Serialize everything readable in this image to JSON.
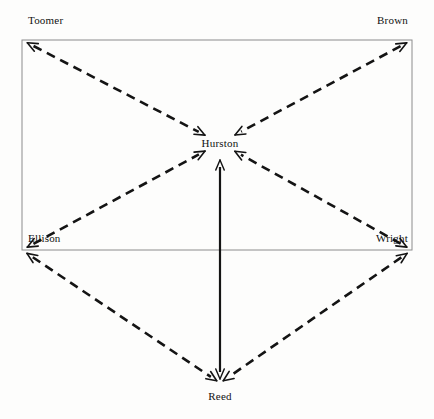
{
  "diagram": {
    "type": "directed-graph",
    "background_color": "#fdfdfc",
    "width": 434,
    "height": 419,
    "frame": {
      "name": "outer-rectangle",
      "stroke_color": "#8c8c8c",
      "stroke_width": 1,
      "x1": 22,
      "y1": 40,
      "x2": 412,
      "y2": 250
    },
    "nodes": [
      {
        "id": "toomer",
        "label": "Toomer",
        "x": 22,
        "y": 40,
        "label_x": 28,
        "label_y": 20,
        "anchor": "left"
      },
      {
        "id": "brown",
        "label": "Brown",
        "x": 412,
        "y": 40,
        "label_x": 408,
        "label_y": 20,
        "anchor": "right"
      },
      {
        "id": "hurston",
        "label": "Hurston",
        "x": 220,
        "y": 143,
        "label_x": 220,
        "label_y": 143,
        "anchor": "center"
      },
      {
        "id": "ellison",
        "label": "Ellison",
        "x": 22,
        "y": 250,
        "label_x": 28,
        "label_y": 238,
        "anchor": "left"
      },
      {
        "id": "wright",
        "label": "Wright",
        "x": 412,
        "y": 250,
        "label_x": 408,
        "label_y": 238,
        "anchor": "right"
      },
      {
        "id": "reed",
        "label": "Reed",
        "x": 220,
        "y": 383,
        "label_x": 220,
        "label_y": 396,
        "anchor": "center"
      }
    ],
    "edges": [
      {
        "id": "toomer-hurston",
        "from": "toomer",
        "to": "hurston",
        "style": "dashed",
        "arrows": "both",
        "color": "#141414",
        "width": 2.6
      },
      {
        "id": "brown-hurston",
        "from": "brown",
        "to": "hurston",
        "style": "dashed",
        "arrows": "both",
        "color": "#141414",
        "width": 2.6
      },
      {
        "id": "ellison-hurston",
        "from": "ellison",
        "to": "hurston",
        "style": "dashed",
        "arrows": "both",
        "color": "#141414",
        "width": 2.6
      },
      {
        "id": "wright-hurston",
        "from": "wright",
        "to": "hurston",
        "style": "dashed",
        "arrows": "both",
        "color": "#141414",
        "width": 2.6
      },
      {
        "id": "hurston-reed",
        "from": "hurston",
        "to": "reed",
        "style": "solid",
        "arrows": "both",
        "color": "#141414",
        "width": 2.2
      },
      {
        "id": "ellison-reed",
        "from": "ellison",
        "to": "reed",
        "style": "dashed",
        "arrows": "both",
        "color": "#141414",
        "width": 2.6
      },
      {
        "id": "wright-reed",
        "from": "wright",
        "to": "reed",
        "style": "dashed",
        "arrows": "both",
        "color": "#141414",
        "width": 2.6
      }
    ]
  },
  "chart_data": {
    "type": "network",
    "title": "",
    "nodes": [
      "Toomer",
      "Brown",
      "Hurston",
      "Ellison",
      "Wright",
      "Reed"
    ],
    "links": [
      {
        "source": "Toomer",
        "target": "Hurston",
        "directed": "bidirectional",
        "line": "dashed"
      },
      {
        "source": "Brown",
        "target": "Hurston",
        "directed": "bidirectional",
        "line": "dashed"
      },
      {
        "source": "Ellison",
        "target": "Hurston",
        "directed": "bidirectional",
        "line": "dashed"
      },
      {
        "source": "Wright",
        "target": "Hurston",
        "directed": "bidirectional",
        "line": "dashed"
      },
      {
        "source": "Hurston",
        "target": "Reed",
        "directed": "bidirectional",
        "line": "solid"
      },
      {
        "source": "Ellison",
        "target": "Reed",
        "directed": "bidirectional",
        "line": "dashed"
      },
      {
        "source": "Wright",
        "target": "Reed",
        "directed": "bidirectional",
        "line": "dashed"
      }
    ],
    "legend": [],
    "grid": false
  }
}
